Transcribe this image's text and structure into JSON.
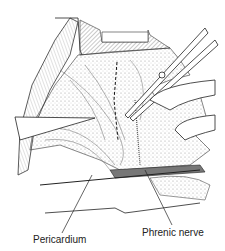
{
  "figure": {
    "labels": {
      "pericardium": "Pericardium",
      "phrenic_nerve": "Phrenic nerve"
    }
  }
}
